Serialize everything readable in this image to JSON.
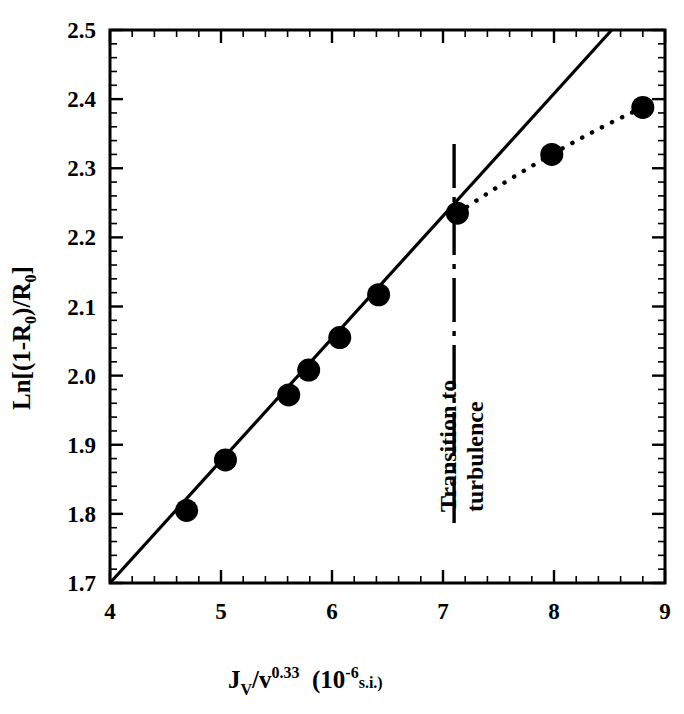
{
  "chart_data": {
    "type": "scatter",
    "title": "",
    "xlabel": "J_V/v^0.33 (10^-6 s.i.)",
    "ylabel": "Ln[(1-R_0)/R_0]",
    "xlim": [
      4,
      9
    ],
    "ylim": [
      1.7,
      2.5
    ],
    "grid": false,
    "legend": null,
    "x_ticks": [
      "4",
      "5",
      "6",
      "7",
      "8",
      "9"
    ],
    "x_tick_values": [
      4,
      5,
      6,
      7,
      8,
      9
    ],
    "x_minor_per_major": 5,
    "y_ticks": [
      "1.7",
      "1.8",
      "1.9",
      "2.0",
      "2.1",
      "2.2",
      "2.3",
      "2.4",
      "2.5"
    ],
    "y_tick_values": [
      1.7,
      1.8,
      1.9,
      2.0,
      2.1,
      2.2,
      2.3,
      2.4,
      2.5
    ],
    "y_minor_per_major": 5,
    "series": [
      {
        "name": "measured data",
        "marker": "filled-circle",
        "x": [
          4.69,
          5.04,
          5.61,
          5.79,
          6.07,
          6.42,
          7.13,
          7.98,
          8.8
        ],
        "y": [
          1.805,
          1.878,
          1.972,
          2.008,
          2.055,
          2.117,
          2.235,
          2.32,
          2.388
        ]
      },
      {
        "name": "linear fit (laminar regime)",
        "style": "solid-line",
        "x": [
          4.0,
          8.52
        ],
        "y": [
          1.7,
          2.5
        ]
      },
      {
        "name": "turbulent regime trend",
        "style": "dotted-line",
        "x": [
          7.13,
          7.98,
          8.8
        ],
        "y": [
          2.235,
          2.32,
          2.388
        ]
      }
    ],
    "annotations": [
      {
        "name": "transition-marker",
        "text_line1": "Transition to",
        "text_line2": "turbulence",
        "style": "dash-dot vertical line",
        "x": 7.1,
        "y_from": 1.775,
        "y_to": 2.335,
        "rotation_deg": -90
      }
    ],
    "colors": {
      "axis": "#000000",
      "marker": "#000000",
      "fit_line": "#000000",
      "background": "#ffffff"
    }
  },
  "axes": {
    "y_label_parts": {
      "prefix": "Ln[(1-R",
      "sub1": "0",
      "middle": ")/R",
      "sub2": "0",
      "suffix": "]"
    },
    "x_label_parts": {
      "j": "J",
      "j_sub": "V",
      "slash_nu": "/v",
      "exponent": "0.33",
      "unit_open": "(10",
      "unit_exp": "-6",
      "unit_rest": "s.i.)"
    }
  }
}
